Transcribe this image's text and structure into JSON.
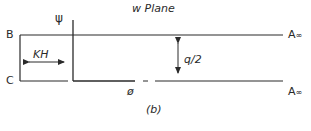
{
  "title": "w Plane",
  "caption": "(b)",
  "labels": {
    "psi": "ψ",
    "phi": "ø",
    "B": "B",
    "C": "C",
    "A_top": "A",
    "A_top_sub": "∞",
    "A_bottom": "A",
    "A_bottom_sub": "∞",
    "KH": "KH",
    "q_half": "q/2"
  },
  "colors": {
    "line": "#2a2a2a",
    "background": "#ffffff"
  }
}
